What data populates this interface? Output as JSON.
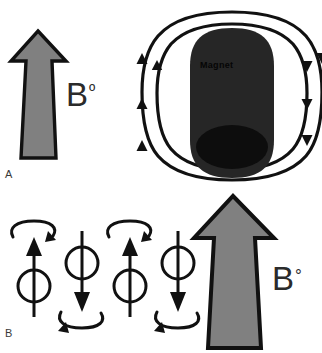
{
  "figure": {
    "background_color": "#ffffff",
    "width": 322,
    "height": 353
  },
  "colors": {
    "background": "#ffffff",
    "arrow_fill": "#808080",
    "arrow_outline": "#111111",
    "magnet_body": "#262626",
    "magnet_pole": "#0d0d0d",
    "field_line": "#111111",
    "text": "#2b2b2b",
    "panel_label": "#3a3a3a",
    "magnet_text": "#050505"
  },
  "panels": [
    {
      "id": "A",
      "label": "A",
      "field_label": "B",
      "field_label_superscript": "º",
      "field_label_full": "Bº",
      "arrow": {
        "name": "bulk-magnetization-arrow",
        "direction": "up",
        "fill": "#808080"
      },
      "magnet": {
        "caption": "Magnet",
        "shape": "rounded-bar",
        "pole_shape": "ellipse"
      },
      "field_lines": {
        "count": 2,
        "left_arrow_direction": "up",
        "right_arrow_direction": "down",
        "left_arrowheads": 3,
        "right_arrowheads": 3
      }
    },
    {
      "id": "B",
      "label": "B",
      "field_label": "B",
      "field_label_superscript": "°",
      "field_label_full": "B°",
      "arrow": {
        "name": "external-field-arrow",
        "direction": "up",
        "fill": "#808080"
      },
      "spins": [
        {
          "index": 1,
          "direction": "up",
          "precession_arc": "top",
          "precession_sense": "counterclockwise"
        },
        {
          "index": 2,
          "direction": "down",
          "precession_arc": "bottom",
          "precession_sense": "counterclockwise"
        },
        {
          "index": 3,
          "direction": "up",
          "precession_arc": "top",
          "precession_sense": "counterclockwise"
        },
        {
          "index": 4,
          "direction": "down",
          "precession_arc": "bottom",
          "precession_sense": "counterclockwise"
        }
      ]
    }
  ]
}
